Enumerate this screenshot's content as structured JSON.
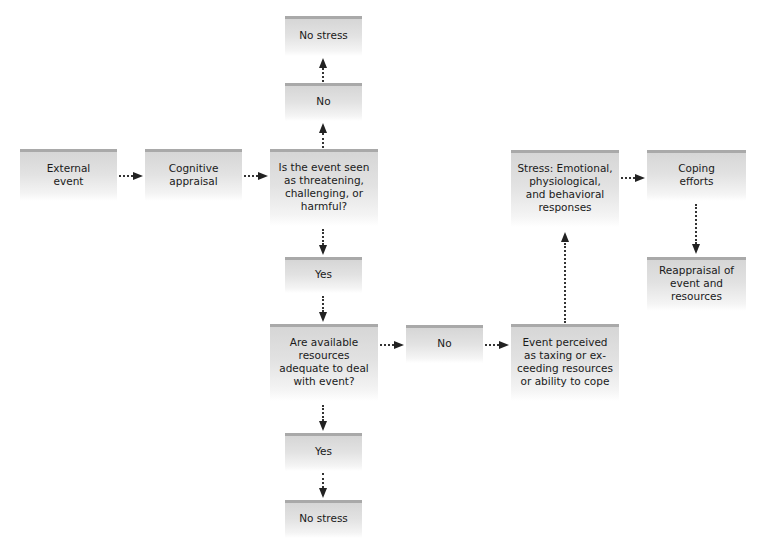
{
  "diagram": {
    "title": "",
    "nodes": {
      "no_stress_top": "No stress",
      "no_top": "No",
      "external_event": "External\nevent",
      "cognitive_appraisal": "Cognitive\nappraisal",
      "threat_question": "Is the event seen\nas threatening,\nchallenging, or\nharmful?",
      "yes_1": "Yes",
      "resources_question": "Are available\nresources\nadequate to deal\nwith event?",
      "no_middle": "No",
      "event_perceived": "Event perceived\nas taxing or ex-\nceeding resources\nor ability to cope",
      "stress_responses": "Stress: Emotional,\nphysiological,\nand behavioral\nresponses",
      "coping_efforts": "Coping\nefforts",
      "reappraisal": "Reappraisal of\nevent and\nresources",
      "yes_2": "Yes",
      "no_stress_bottom": "No stress"
    },
    "edges": [
      {
        "from": "external_event",
        "to": "cognitive_appraisal"
      },
      {
        "from": "cognitive_appraisal",
        "to": "threat_question"
      },
      {
        "from": "threat_question",
        "to": "no_top"
      },
      {
        "from": "no_top",
        "to": "no_stress_top"
      },
      {
        "from": "threat_question",
        "to": "yes_1"
      },
      {
        "from": "yes_1",
        "to": "resources_question"
      },
      {
        "from": "resources_question",
        "to": "no_middle"
      },
      {
        "from": "no_middle",
        "to": "event_perceived"
      },
      {
        "from": "event_perceived",
        "to": "stress_responses"
      },
      {
        "from": "stress_responses",
        "to": "coping_efforts"
      },
      {
        "from": "coping_efforts",
        "to": "reappraisal"
      },
      {
        "from": "resources_question",
        "to": "yes_2"
      },
      {
        "from": "yes_2",
        "to": "no_stress_bottom"
      }
    ],
    "colors": {
      "box_top_border": "#a9a9a9",
      "box_fill_top": "#d6d6d6",
      "box_fill_bottom": "#ffffff",
      "arrow": "#222222"
    }
  }
}
